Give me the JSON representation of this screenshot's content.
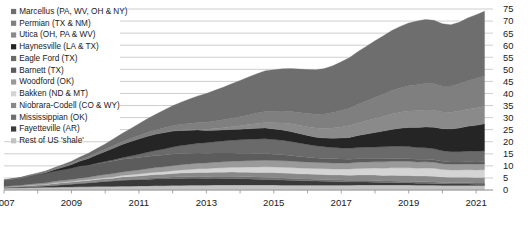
{
  "chart_data": {
    "type": "area",
    "stacked": true,
    "title": "",
    "subtitle": "",
    "xlabel": "",
    "ylabel": "",
    "xlim": [
      2007,
      2021.5
    ],
    "ylim": [
      0,
      75
    ],
    "ytick_step": 5,
    "yticks": [
      0,
      5,
      10,
      15,
      20,
      25,
      30,
      35,
      40,
      45,
      50,
      55,
      60,
      65,
      70,
      75
    ],
    "ytick_labels": [
      "0",
      "5",
      "10",
      "15",
      "20",
      "25",
      "30",
      "35",
      "40",
      "45",
      "50",
      "55",
      "60",
      "65",
      "70",
      "75"
    ],
    "xticks": [
      2007,
      2009,
      2011,
      2013,
      2015,
      2017,
      2019,
      2021
    ],
    "xtick_labels": [
      "2007",
      "2009",
      "2011",
      "2013",
      "2015",
      "2017",
      "2019",
      "2021"
    ],
    "grid": true,
    "grid_axis": "y",
    "legend_position": "top-left-inside",
    "x": [
      2007.0,
      2007.25,
      2007.5,
      2007.75,
      2008.0,
      2008.25,
      2008.5,
      2008.75,
      2009.0,
      2009.25,
      2009.5,
      2009.75,
      2010.0,
      2010.25,
      2010.5,
      2010.75,
      2011.0,
      2011.25,
      2011.5,
      2011.75,
      2012.0,
      2012.25,
      2012.5,
      2012.75,
      2013.0,
      2013.25,
      2013.5,
      2013.75,
      2014.0,
      2014.25,
      2014.5,
      2014.75,
      2015.0,
      2015.25,
      2015.5,
      2015.75,
      2016.0,
      2016.25,
      2016.5,
      2016.75,
      2017.0,
      2017.25,
      2017.5,
      2017.75,
      2018.0,
      2018.25,
      2018.5,
      2018.75,
      2019.0,
      2019.25,
      2019.5,
      2019.75,
      2020.0,
      2020.25,
      2020.5,
      2020.75,
      2021.0,
      2021.25
    ],
    "series": [
      {
        "name": "Marcellus (PA, WV, OH & NY)",
        "color": "#6e6e6e",
        "stack_order": 1,
        "values": [
          0.0,
          0.0,
          0.1,
          0.1,
          0.2,
          0.3,
          0.4,
          0.6,
          0.8,
          1.1,
          1.4,
          1.8,
          2.2,
          2.8,
          3.4,
          4.1,
          4.9,
          5.7,
          6.5,
          7.4,
          8.3,
          9.2,
          10.1,
          11.0,
          11.9,
          12.7,
          13.5,
          14.3,
          15.0,
          15.7,
          16.3,
          16.9,
          17.2,
          17.5,
          17.8,
          18.0,
          18.2,
          18.4,
          18.8,
          19.4,
          20.2,
          21.0,
          21.9,
          22.7,
          23.5,
          24.2,
          24.9,
          25.5,
          26.0,
          26.4,
          26.6,
          26.3,
          25.8,
          25.4,
          25.5,
          26.0,
          26.4,
          26.8
        ]
      },
      {
        "name": "Permian (TX & NM)",
        "color": "#7f7f7f",
        "stack_order": 2,
        "values": [
          0.2,
          0.2,
          0.2,
          0.3,
          0.3,
          0.4,
          0.4,
          0.5,
          0.5,
          0.6,
          0.7,
          0.8,
          0.9,
          1.0,
          1.1,
          1.2,
          1.4,
          1.5,
          1.7,
          1.9,
          2.1,
          2.3,
          2.5,
          2.7,
          2.9,
          3.1,
          3.3,
          3.5,
          3.8,
          4.0,
          4.3,
          4.5,
          4.7,
          4.9,
          5.1,
          5.3,
          5.5,
          5.7,
          6.0,
          6.4,
          6.8,
          7.2,
          7.7,
          8.2,
          8.7,
          9.2,
          9.7,
          10.1,
          10.5,
          10.8,
          11.0,
          11.0,
          10.8,
          10.9,
          11.3,
          11.8,
          12.2,
          12.6
        ]
      },
      {
        "name": "Utica (OH, PA & WV)",
        "color": "#8a8a8a",
        "stack_order": 3,
        "values": [
          0.0,
          0.0,
          0.0,
          0.0,
          0.0,
          0.0,
          0.0,
          0.0,
          0.0,
          0.0,
          0.0,
          0.0,
          0.0,
          0.0,
          0.0,
          0.0,
          0.0,
          0.0,
          0.0,
          0.1,
          0.1,
          0.2,
          0.3,
          0.4,
          0.5,
          0.7,
          0.9,
          1.1,
          1.4,
          1.7,
          2.0,
          2.3,
          2.6,
          2.9,
          3.2,
          3.4,
          3.6,
          3.8,
          4.0,
          4.3,
          4.6,
          4.9,
          5.2,
          5.5,
          5.8,
          6.1,
          6.4,
          6.6,
          6.8,
          6.9,
          7.0,
          7.0,
          6.9,
          6.9,
          7.0,
          7.1,
          7.2,
          7.3
        ]
      },
      {
        "name": "Haynesville (LA & TX)",
        "color": "#252525",
        "stack_order": 4,
        "values": [
          0.0,
          0.0,
          0.0,
          0.1,
          0.2,
          0.4,
          0.7,
          1.1,
          1.6,
          2.2,
          2.8,
          3.5,
          4.2,
          4.9,
          5.5,
          6.0,
          6.4,
          6.7,
          6.8,
          6.8,
          6.6,
          6.3,
          5.9,
          5.5,
          5.1,
          4.8,
          4.6,
          4.5,
          4.4,
          4.4,
          4.5,
          4.5,
          4.4,
          4.3,
          4.1,
          3.9,
          3.7,
          3.6,
          3.6,
          3.8,
          4.1,
          4.5,
          5.0,
          5.5,
          6.0,
          6.5,
          7.0,
          7.5,
          7.9,
          8.3,
          8.6,
          8.9,
          9.1,
          9.4,
          9.8,
          10.3,
          10.7,
          11.1
        ]
      },
      {
        "name": "Eagle Ford (TX)",
        "color": "#6a6a6a",
        "stack_order": 5,
        "values": [
          0.0,
          0.0,
          0.0,
          0.0,
          0.0,
          0.0,
          0.0,
          0.0,
          0.0,
          0.1,
          0.1,
          0.2,
          0.3,
          0.5,
          0.7,
          1.0,
          1.3,
          1.7,
          2.1,
          2.5,
          2.9,
          3.3,
          3.7,
          4.1,
          4.4,
          4.7,
          5.0,
          5.3,
          5.6,
          5.8,
          6.0,
          6.1,
          6.1,
          6.0,
          5.8,
          5.6,
          5.3,
          5.0,
          4.8,
          4.7,
          4.6,
          4.6,
          4.6,
          4.7,
          4.8,
          4.9,
          5.0,
          5.0,
          5.0,
          4.9,
          4.8,
          4.6,
          4.4,
          4.3,
          4.3,
          4.4,
          4.5,
          4.6
        ]
      },
      {
        "name": "Barnett (TX)",
        "color": "#5c5c5c",
        "stack_order": 6,
        "values": [
          2.5,
          2.7,
          3.0,
          3.3,
          3.6,
          3.9,
          4.2,
          4.4,
          4.6,
          4.8,
          4.9,
          5.0,
          5.1,
          5.2,
          5.2,
          5.2,
          5.2,
          5.1,
          5.0,
          4.9,
          4.8,
          4.6,
          4.4,
          4.2,
          4.0,
          3.8,
          3.6,
          3.4,
          3.2,
          3.1,
          2.9,
          2.8,
          2.6,
          2.5,
          2.3,
          2.2,
          2.0,
          1.9,
          1.8,
          1.7,
          1.6,
          1.5,
          1.5,
          1.4,
          1.3,
          1.3,
          1.2,
          1.2,
          1.1,
          1.1,
          1.0,
          1.0,
          1.0,
          0.9,
          0.9,
          0.9,
          0.9,
          0.9
        ]
      },
      {
        "name": "Woodford (OK)",
        "color": "#9a9a9a",
        "stack_order": 7,
        "values": [
          0.2,
          0.3,
          0.3,
          0.4,
          0.5,
          0.6,
          0.7,
          0.8,
          0.9,
          1.0,
          1.1,
          1.2,
          1.3,
          1.4,
          1.5,
          1.6,
          1.7,
          1.8,
          1.9,
          2.0,
          2.1,
          2.2,
          2.3,
          2.3,
          2.4,
          2.4,
          2.5,
          2.5,
          2.6,
          2.6,
          2.7,
          2.7,
          2.7,
          2.7,
          2.7,
          2.6,
          2.6,
          2.5,
          2.5,
          2.5,
          2.5,
          2.5,
          2.6,
          2.6,
          2.6,
          2.7,
          2.7,
          2.7,
          2.7,
          2.6,
          2.6,
          2.5,
          2.4,
          2.4,
          2.4,
          2.4,
          2.4,
          2.4
        ]
      },
      {
        "name": "Bakken (ND & MT)",
        "color": "#d4d4d4",
        "stack_order": 8,
        "values": [
          0.0,
          0.0,
          0.0,
          0.1,
          0.1,
          0.1,
          0.2,
          0.2,
          0.2,
          0.3,
          0.3,
          0.4,
          0.4,
          0.5,
          0.6,
          0.7,
          0.8,
          0.9,
          1.0,
          1.1,
          1.2,
          1.3,
          1.4,
          1.5,
          1.6,
          1.7,
          1.8,
          1.9,
          2.0,
          2.1,
          2.2,
          2.3,
          2.3,
          2.4,
          2.4,
          2.4,
          2.4,
          2.4,
          2.4,
          2.5,
          2.5,
          2.6,
          2.7,
          2.8,
          2.9,
          3.0,
          3.1,
          3.2,
          3.2,
          3.2,
          3.3,
          3.3,
          3.1,
          3.0,
          3.0,
          3.1,
          3.1,
          3.2
        ]
      },
      {
        "name": "Niobrara-Codell (CO & WY)",
        "color": "#888888",
        "stack_order": 9,
        "values": [
          0.3,
          0.3,
          0.4,
          0.4,
          0.5,
          0.5,
          0.6,
          0.6,
          0.7,
          0.7,
          0.8,
          0.8,
          0.9,
          0.9,
          1.0,
          1.1,
          1.1,
          1.2,
          1.3,
          1.3,
          1.4,
          1.5,
          1.5,
          1.6,
          1.6,
          1.7,
          1.7,
          1.8,
          1.8,
          1.9,
          1.9,
          2.0,
          2.0,
          2.0,
          2.0,
          2.0,
          2.0,
          2.0,
          2.0,
          2.0,
          2.1,
          2.1,
          2.2,
          2.2,
          2.3,
          2.3,
          2.4,
          2.4,
          2.4,
          2.4,
          2.4,
          2.4,
          2.3,
          2.3,
          2.3,
          2.3,
          2.3,
          2.3
        ]
      },
      {
        "name": "Mississippian (OK)",
        "color": "#6f6f6f",
        "stack_order": 10,
        "values": [
          0.1,
          0.1,
          0.1,
          0.1,
          0.1,
          0.1,
          0.2,
          0.2,
          0.2,
          0.2,
          0.2,
          0.3,
          0.3,
          0.3,
          0.4,
          0.4,
          0.4,
          0.5,
          0.5,
          0.6,
          0.6,
          0.7,
          0.7,
          0.8,
          0.8,
          0.8,
          0.9,
          0.9,
          0.9,
          0.9,
          0.9,
          0.9,
          0.9,
          0.9,
          0.9,
          0.8,
          0.8,
          0.8,
          0.8,
          0.7,
          0.7,
          0.7,
          0.7,
          0.7,
          0.7,
          0.6,
          0.6,
          0.6,
          0.6,
          0.6,
          0.6,
          0.6,
          0.5,
          0.5,
          0.5,
          0.5,
          0.5,
          0.5
        ]
      },
      {
        "name": "Fayetteville (AR)",
        "color": "#3a3a3a",
        "stack_order": 11,
        "values": [
          0.1,
          0.2,
          0.3,
          0.4,
          0.5,
          0.6,
          0.8,
          1.0,
          1.2,
          1.4,
          1.6,
          1.8,
          2.0,
          2.2,
          2.4,
          2.5,
          2.6,
          2.7,
          2.8,
          2.8,
          2.9,
          2.9,
          2.9,
          2.9,
          2.8,
          2.8,
          2.7,
          2.7,
          2.6,
          2.5,
          2.4,
          2.3,
          2.2,
          2.1,
          2.0,
          1.9,
          1.8,
          1.7,
          1.6,
          1.5,
          1.4,
          1.3,
          1.2,
          1.2,
          1.1,
          1.0,
          1.0,
          0.9,
          0.9,
          0.8,
          0.8,
          0.7,
          0.7,
          0.6,
          0.6,
          0.6,
          0.5,
          0.5
        ]
      },
      {
        "name": "Rest of US 'shale'",
        "color": "#c2c2c2",
        "stack_order": 12,
        "values": [
          0.8,
          0.9,
          0.9,
          1.0,
          1.0,
          1.1,
          1.1,
          1.2,
          1.2,
          1.3,
          1.3,
          1.4,
          1.5,
          1.5,
          1.6,
          1.6,
          1.7,
          1.7,
          1.8,
          1.8,
          1.9,
          1.9,
          2.0,
          2.0,
          2.0,
          2.1,
          2.1,
          2.1,
          2.1,
          2.1,
          2.1,
          2.1,
          2.1,
          2.0,
          2.0,
          2.0,
          2.0,
          2.0,
          2.0,
          2.0,
          2.0,
          2.0,
          2.1,
          2.1,
          2.1,
          2.1,
          2.1,
          2.1,
          2.1,
          2.0,
          2.0,
          2.0,
          1.9,
          1.9,
          1.9,
          1.9,
          1.9,
          1.9
        ]
      }
    ]
  },
  "legend": {
    "items": [
      {
        "label": "Marcellus (PA, WV, OH & NY)",
        "color": "#6e6e6e"
      },
      {
        "label": "Permian (TX & NM)",
        "color": "#7f7f7f"
      },
      {
        "label": "Utica (OH, PA & WV)",
        "color": "#8a8a8a"
      },
      {
        "label": "Haynesville (LA & TX)",
        "color": "#252525"
      },
      {
        "label": "Eagle Ford (TX)",
        "color": "#6a6a6a"
      },
      {
        "label": "Barnett (TX)",
        "color": "#5c5c5c"
      },
      {
        "label": "Woodford (OK)",
        "color": "#9a9a9a"
      },
      {
        "label": "Bakken (ND & MT)",
        "color": "#d4d4d4"
      },
      {
        "label": "Niobrara-Codell (CO & WY)",
        "color": "#888888"
      },
      {
        "label": "Mississippian (OK)",
        "color": "#6f6f6f"
      },
      {
        "label": "Fayetteville (AR)",
        "color": "#3a3a3a"
      },
      {
        "label": "Rest of US 'shale'",
        "color": "#c2c2c2"
      }
    ]
  },
  "style": {
    "grid_color": "#b9b9b9",
    "axis_color": "#8f8f8f",
    "text_color": "#1a1a1a",
    "background": "#ffffff"
  }
}
